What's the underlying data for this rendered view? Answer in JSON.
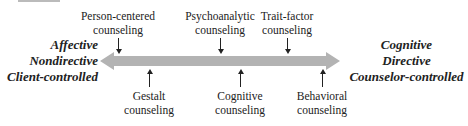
{
  "diagram": {
    "type": "continuum",
    "left_pole": [
      "Affective",
      "Nondirective",
      "Client-controlled"
    ],
    "right_pole": [
      "Cognitive",
      "Directive",
      "Counselor-controlled"
    ],
    "bar_color": "#b3b3b3",
    "above": [
      {
        "line1": "Person-centered",
        "line2": "counseling",
        "x": 118
      },
      {
        "line1": "Psychoanalytic",
        "line2": "counseling",
        "x": 220
      },
      {
        "line1": "Trait-factor",
        "line2": "counseling",
        "x": 287
      }
    ],
    "below": [
      {
        "line1": "Gestalt",
        "line2": "counseling",
        "x": 149
      },
      {
        "line1": "Cognitive",
        "line2": "counseling",
        "x": 240
      },
      {
        "line1": "Behavioral",
        "line2": "counseling",
        "x": 322
      }
    ]
  }
}
